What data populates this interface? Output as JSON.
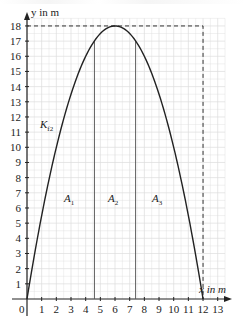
{
  "chart_data": {
    "type": "line",
    "title": "",
    "xlabel": "x in m",
    "ylabel": "y in m",
    "xlim": [
      0,
      13
    ],
    "ylim": [
      0,
      18
    ],
    "x_ticks": [
      "0",
      "1",
      "2",
      "3",
      "4",
      "5",
      "6",
      "7",
      "8",
      "9",
      "10",
      "11",
      "12",
      "13"
    ],
    "y_ticks": [
      "1",
      "2",
      "3",
      "4",
      "5",
      "6",
      "7",
      "8",
      "9",
      "10",
      "11",
      "12",
      "13",
      "14",
      "15",
      "16",
      "17",
      "18"
    ],
    "grid": true,
    "series": [
      {
        "name": "K_f2",
        "label_main": "K",
        "label_sub": "f2",
        "function": "f(x) = -0.5*(x-6)^2 + 18",
        "x": [
          0,
          1,
          2,
          3,
          4,
          4.6,
          5,
          6,
          7,
          7.4,
          8,
          9,
          10,
          11,
          12
        ],
        "y": [
          0,
          5.5,
          10,
          13.5,
          16,
          17.02,
          17.5,
          18,
          17.5,
          17.02,
          16,
          13.5,
          10,
          5.5,
          0
        ]
      }
    ],
    "vertical_lines": [
      4.6,
      7.4
    ],
    "dashed_box": {
      "x": [
        0,
        12
      ],
      "y": [
        0,
        18
      ]
    },
    "annotations": [
      {
        "main": "A",
        "sub": "1",
        "x": 2.9,
        "y": 6.6
      },
      {
        "main": "A",
        "sub": "2",
        "x": 5.9,
        "y": 6.6
      },
      {
        "main": "A",
        "sub": "3",
        "x": 8.9,
        "y": 6.6
      }
    ]
  },
  "labels": {
    "origin": "0",
    "x_axis": "x in m",
    "y_axis": "y in m",
    "curve_main": "K",
    "curve_sub": "f2",
    "a1_main": "A",
    "a1_sub": "1",
    "a2_main": "A",
    "a2_sub": "2",
    "a3_main": "A",
    "a3_sub": "3"
  }
}
